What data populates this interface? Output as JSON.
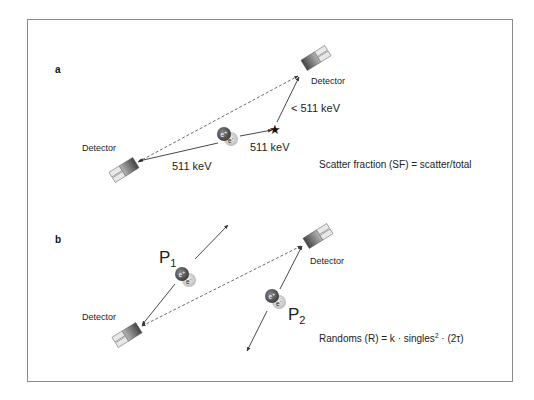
{
  "figure": {
    "panel_a": {
      "letter": "a",
      "detector_top_label": "Detector",
      "detector_left_label": "Detector",
      "energy_left": "511 keV",
      "energy_right": "511 keV",
      "energy_scattered": "< 511 keV",
      "positron": "e+",
      "electron": "e-",
      "scatter_marker": "star",
      "formula": "Scatter fraction (SF) = scatter/total"
    },
    "panel_b": {
      "letter": "b",
      "detector_top_label": "Detector",
      "detector_left_label": "Detector",
      "p1_label": "P",
      "p1_sub": "1",
      "p2_label": "P",
      "p2_sub": "2",
      "positron": "e+",
      "electron": "e-",
      "formula_prefix": "Randoms (R) = k · singles",
      "formula_sup": "2",
      "formula_suffix": " · (2τ)"
    }
  },
  "colors": {
    "frame": "#8a8a8a",
    "line": "#333333",
    "positron": "#555555",
    "electron": "#bdbdbd"
  }
}
